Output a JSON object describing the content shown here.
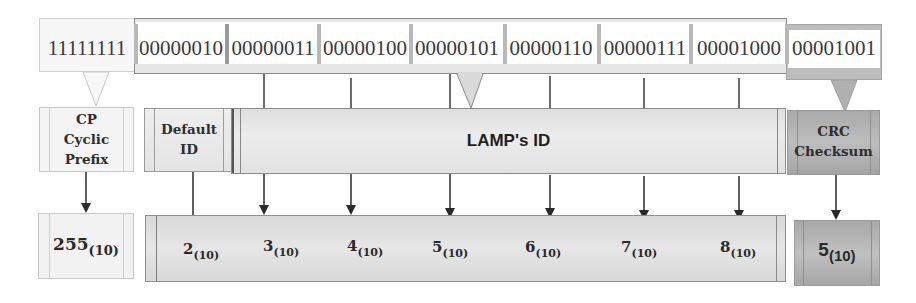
{
  "diagram": {
    "bit_row": {
      "cp_bits": "11111111",
      "segments": [
        {
          "bits": "00000010"
        },
        {
          "bits": "00000011"
        },
        {
          "bits": "00000100"
        },
        {
          "bits": "00000101"
        },
        {
          "bits": "00000110"
        },
        {
          "bits": "00000111"
        },
        {
          "bits": "00001000"
        }
      ],
      "crc_bits": "00001001"
    },
    "fields": {
      "cp": {
        "line1": "CP",
        "line2": "Cyclic",
        "line3": "Prefix"
      },
      "default_id": {
        "line1": "Default",
        "line2": "ID"
      },
      "lamp_id": {
        "label": "LAMP's ID"
      },
      "crc": {
        "line1": "CRC",
        "line2": "Checksum"
      }
    },
    "decimal_values": {
      "cp": {
        "value": "255",
        "base": "(10)"
      },
      "ids": [
        {
          "value": "2",
          "base": "(10)"
        },
        {
          "value": "3",
          "base": "(10)"
        },
        {
          "value": "4",
          "base": "(10)"
        },
        {
          "value": "5",
          "base": "(10)"
        },
        {
          "value": "6",
          "base": "(10)"
        },
        {
          "value": "7",
          "base": "(10)"
        },
        {
          "value": "8",
          "base": "(10)"
        }
      ],
      "crc": {
        "value": "5",
        "base": "(10)"
      }
    },
    "colors": {
      "line": "#3a3a3a",
      "light_box": "#f4f4f4",
      "mid_box": "#e4e4e4",
      "dark_box": "#b0b0b0"
    }
  }
}
